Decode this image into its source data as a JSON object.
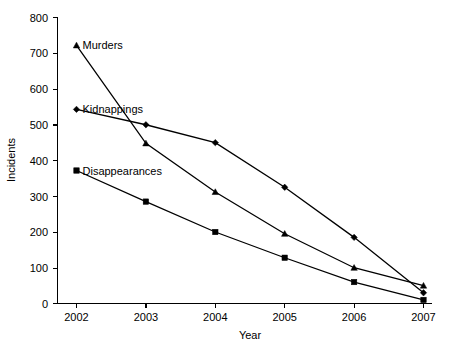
{
  "chart_data": {
    "type": "line",
    "title": "",
    "subtitle": "",
    "xlabel": "Year",
    "ylabel": "Incidents",
    "x": [
      2002,
      2003,
      2004,
      2005,
      2006,
      2007
    ],
    "categories": [
      "2002",
      "2003",
      "2004",
      "2005",
      "2006",
      "2007"
    ],
    "xlim": [
      2002,
      2007
    ],
    "ylim": [
      0,
      800
    ],
    "ytick_values": [
      0,
      100,
      200,
      300,
      400,
      500,
      600,
      700,
      800
    ],
    "ytick_labels": [
      "0",
      "100",
      "200",
      "300",
      "400",
      "500",
      "600",
      "700",
      "800"
    ],
    "xtick_labels": [
      "2002",
      "2003",
      "2004",
      "2005",
      "2006",
      "2007"
    ],
    "grid": false,
    "legend": "inline-labels-at-first-point",
    "series": [
      {
        "name": "Murders",
        "marker": "triangle",
        "color": "#000000",
        "values": [
          722,
          448,
          312,
          195,
          100,
          50
        ]
      },
      {
        "name": "Kidnappings",
        "marker": "diamond",
        "color": "#000000",
        "values": [
          543,
          500,
          450,
          325,
          185,
          30
        ]
      },
      {
        "name": "Disappearances",
        "marker": "square",
        "color": "#000000",
        "values": [
          372,
          285,
          200,
          128,
          60,
          10
        ]
      }
    ],
    "annotations": [
      {
        "text": "Murders",
        "series": "Murders",
        "at_x": 2002
      },
      {
        "text": "Kidnappings",
        "series": "Kidnappings",
        "at_x": 2002
      },
      {
        "text": "Disappearances",
        "series": "Disappearances",
        "at_x": 2002
      }
    ]
  },
  "axes": {
    "y_title": "Incidents",
    "x_title": "Year"
  }
}
